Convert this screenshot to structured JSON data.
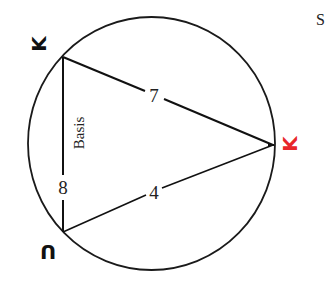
{
  "diagram": {
    "corner_letter": "S",
    "circle": {
      "stroke": "#1a1a1a"
    },
    "vertices": {
      "top": {
        "label": "K",
        "rotated": true,
        "color": "#111111"
      },
      "bottom": {
        "label": "U",
        "rotated": true,
        "color": "#111111"
      },
      "right": {
        "label": "K",
        "rotated": true,
        "color": "#e8262a"
      }
    },
    "edges": {
      "top_right": {
        "label": "7"
      },
      "bottom_right": {
        "label": "4"
      },
      "left": {
        "label": "8",
        "caption": "Basis"
      }
    }
  }
}
